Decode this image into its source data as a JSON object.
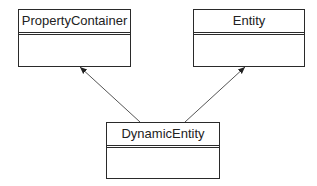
{
  "diagram": {
    "type": "uml-class",
    "classes": [
      {
        "id": "property-container",
        "name": "PropertyContainer"
      },
      {
        "id": "entity",
        "name": "Entity"
      },
      {
        "id": "dynamic-entity",
        "name": "DynamicEntity"
      }
    ],
    "relations": [
      {
        "from": "DynamicEntity",
        "to": "PropertyContainer",
        "kind": "association-arrow"
      },
      {
        "from": "DynamicEntity",
        "to": "Entity",
        "kind": "association-arrow"
      }
    ]
  }
}
